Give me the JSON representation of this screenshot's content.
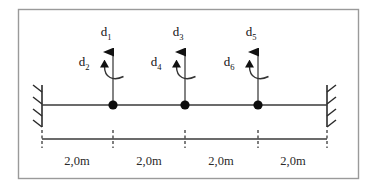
{
  "figure": {
    "border_color": "#9a9a9a",
    "line_color": "#3a3a3a",
    "ink_color": "#111111",
    "background": "#ffffff"
  },
  "beam": {
    "left_support_type": "fixed-wall-hatched",
    "right_support_type": "fixed-wall-hatched",
    "node_count": 3,
    "node_marker": "filled-circle"
  },
  "dofs": [
    {
      "translation_label": "d",
      "translation_sub": "1",
      "rotation_label": "d",
      "rotation_sub": "2"
    },
    {
      "translation_label": "d",
      "translation_sub": "3",
      "rotation_label": "d",
      "rotation_sub": "4"
    },
    {
      "translation_label": "d",
      "translation_sub": "5",
      "rotation_label": "d",
      "rotation_sub": "6"
    }
  ],
  "dimensions": {
    "segments": [
      {
        "label": "2,0m"
      },
      {
        "label": "2,0m"
      },
      {
        "label": "2,0m"
      },
      {
        "label": "2,0m"
      }
    ]
  }
}
